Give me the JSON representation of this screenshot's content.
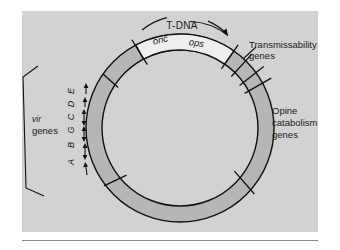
{
  "figure": {
    "type": "ti-plasmid-map",
    "panel_background": "#d2d2d2",
    "ring_fill": "#b6b6b6",
    "tdna_segment_fill": "#eeeeee",
    "stroke_color": "#111111",
    "labels": {
      "tdna": "T-DNA",
      "onc": "onc",
      "ops": "ops",
      "transmissability_line1": "Transmissability",
      "transmissability_line2": "genes",
      "opine_line1": "Opine",
      "opine_line2": "catabolism",
      "opine_line3": "genes",
      "vir_line1": "vir",
      "vir_line2": "genes"
    },
    "vir_gene_letters": [
      "E",
      "D",
      "C",
      "G",
      "B",
      "A"
    ],
    "region_names": [
      "T-DNA",
      "Transmissability genes",
      "Opine catabolism genes",
      "vir genes"
    ]
  }
}
